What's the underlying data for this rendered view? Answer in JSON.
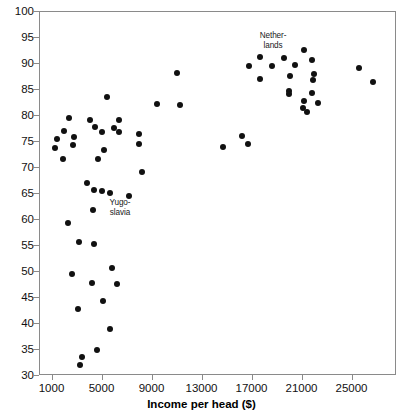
{
  "chart_data": {
    "type": "scatter",
    "title": "",
    "xlabel": "Income per head ($)",
    "ylabel": "",
    "xlim": [
      0,
      28560
    ],
    "ylim": [
      30,
      100
    ],
    "xticks": [
      1000,
      5000,
      9000,
      13000,
      17000,
      21000,
      25000
    ],
    "yticks": [
      30,
      35,
      40,
      45,
      50,
      55,
      60,
      65,
      70,
      75,
      80,
      85,
      90,
      95,
      100
    ],
    "grid": false,
    "legend": null,
    "point_color": "#111111",
    "frame_color": "#8a8a8a",
    "points": [
      {
        "label": "Philippines",
        "x": 2400,
        "y": 79.5,
        "lx": 78,
        "ly": 98,
        "align": "r"
      },
      {
        "label": "Brazil",
        "x": 4100,
        "y": 79.0,
        "lx": 127,
        "ly": 98,
        "align": "c"
      },
      {
        "label": "Ghana",
        "x": 2000,
        "y": 77.0,
        "lx": 73,
        "ly": 110,
        "align": "r"
      },
      {
        "label": "Mexico",
        "x": 4500,
        "y": 77.7,
        "lx": 135,
        "ly": 107,
        "align": "c"
      },
      {
        "label": "Colombia",
        "x": 5400,
        "y": 83.5,
        "lx": 125,
        "ly": 86,
        "align": "c"
      },
      {
        "label": "Nigeria",
        "x": 1400,
        "y": 75.3,
        "lx": 60,
        "ly": 123,
        "align": "r"
      },
      {
        "label": "China",
        "x": 2800,
        "y": 75.7,
        "lx": 97,
        "ly": 122,
        "align": "c"
      },
      {
        "label": "Venezuela",
        "x": 6400,
        "y": 79.0,
        "lx": 148,
        "ly": 97,
        "align": "c"
      },
      {
        "label": "Taiwan",
        "x": 9400,
        "y": 82.2,
        "lx": 155,
        "ly": 87,
        "align": "c"
      },
      {
        "label": "Uruguay",
        "x": 6000,
        "y": 77.5,
        "lx": 148,
        "ly": 111,
        "align": "c"
      },
      {
        "label": "Bangladesh",
        "x": 1300,
        "y": 73.7,
        "lx": 57,
        "ly": 139,
        "align": "r"
      },
      {
        "label": "Pakistan",
        "x": 2700,
        "y": 74.2,
        "lx": 96,
        "ly": 139,
        "align": "c"
      },
      {
        "label": "Dom. Rep.",
        "x": 5000,
        "y": 76.7,
        "lx": 134,
        "ly": 127,
        "align": "c"
      },
      {
        "label": "Argentina",
        "x": 6400,
        "y": 76.8,
        "lx": 158,
        "ly": 122,
        "align": "c"
      },
      {
        "label": "Chile",
        "x": 8000,
        "y": 76.4,
        "lx": 182,
        "ly": 113,
        "align": "c"
      },
      {
        "label": "Poland",
        "x": 5200,
        "y": 73.3,
        "lx": 140,
        "ly": 149,
        "align": "c"
      },
      {
        "label": "India",
        "x": 1900,
        "y": 71.5,
        "lx": 68,
        "ly": 156,
        "align": "c"
      },
      {
        "label": "Turkey",
        "x": 4700,
        "y": 71.5,
        "lx": 124,
        "ly": 164,
        "align": "c"
      },
      {
        "label": "Czech",
        "x": 8000,
        "y": 74.5,
        "lx": 174,
        "ly": 141,
        "align": "c"
      },
      {
        "label": "South Korea",
        "x": 11300,
        "y": 82.0,
        "lx": 195,
        "ly": 88,
        "align": "c"
      },
      {
        "label": "Puerto Rico",
        "x": 11000,
        "y": 88.0,
        "lx": 192,
        "ly": 70,
        "align": "c"
      },
      {
        "label": "Portugal",
        "x": 14700,
        "y": 73.8,
        "lx": 210,
        "ly": 123,
        "align": "c"
      },
      {
        "label": "Spain",
        "x": 16200,
        "y": 76.0,
        "lx": 227,
        "ly": 104,
        "align": "c"
      },
      {
        "label": "East Germany",
        "x": 16700,
        "y": 74.4,
        "lx": 248,
        "ly": 111,
        "align": "c"
      },
      {
        "label": "Slovenia",
        "x": 8200,
        "y": 69.0,
        "lx": 158,
        "ly": 173,
        "align": "c"
      },
      {
        "label": "S. Africa",
        "x": 3800,
        "y": 67.0,
        "lx": 97,
        "ly": 180,
        "align": "c"
      },
      {
        "label": "Croatia",
        "x": 5000,
        "y": 65.3,
        "lx": 138,
        "ly": 190,
        "align": "c"
      },
      {
        "label": "Slovakia",
        "x": 4400,
        "y": 65.5,
        "lx": 87,
        "ly": 200,
        "align": "c"
      },
      {
        "label": "Yugo-slavia",
        "x": 5700,
        "y": 65.0,
        "lx": 120,
        "ly": 198,
        "align": "c"
      },
      {
        "label": "Hungary",
        "x": 7200,
        "y": 64.5,
        "lx": 156,
        "ly": 201,
        "align": "c"
      },
      {
        "label": "Peru",
        "x": 4300,
        "y": 61.7,
        "lx": 97,
        "ly": 216,
        "align": "c"
      },
      {
        "label": "Macedonia",
        "x": 2300,
        "y": 59.2,
        "lx": 72,
        "ly": 217,
        "align": "c"
      },
      {
        "label": "Azerbaijan",
        "x": 3200,
        "y": 55.5,
        "lx": 86,
        "ly": 236,
        "align": "c"
      },
      {
        "label": "Latvia",
        "x": 4400,
        "y": 55.2,
        "lx": 115,
        "ly": 243,
        "align": "c"
      },
      {
        "label": "Estonia",
        "x": 5800,
        "y": 50.5,
        "lx": 136,
        "ly": 253,
        "align": "c"
      },
      {
        "label": "Romania",
        "x": 6200,
        "y": 47.5,
        "lx": 145,
        "ly": 279,
        "align": "c"
      },
      {
        "label": "Georgia",
        "x": 2600,
        "y": 49.5,
        "lx": 75,
        "ly": 279,
        "align": "c"
      },
      {
        "label": "Lithuania",
        "x": 4200,
        "y": 47.7,
        "lx": 105,
        "ly": 290,
        "align": "c"
      },
      {
        "label": "Armenia",
        "x": 3100,
        "y": 42.6,
        "lx": 78,
        "ly": 300,
        "align": "c"
      },
      {
        "label": "Bulgaria",
        "x": 5100,
        "y": 44.3,
        "lx": 123,
        "ly": 303,
        "align": "c"
      },
      {
        "label": "Russia",
        "x": 5700,
        "y": 38.9,
        "lx": 129,
        "ly": 330,
        "align": "c"
      },
      {
        "label": "Ukraine",
        "x": 3400,
        "y": 33.5,
        "lx": 83,
        "ly": 347,
        "align": "c"
      },
      {
        "label": "Belarus",
        "x": 4600,
        "y": 34.8,
        "lx": 133,
        "ly": 348,
        "align": "c"
      },
      {
        "label": "Moldova",
        "x": 3300,
        "y": 32.0,
        "lx": 105,
        "ly": 361,
        "align": "c"
      },
      {
        "label": "Ireland",
        "x": 16800,
        "y": 89.5,
        "lx": 221,
        "ly": 55,
        "align": "r"
      },
      {
        "label": "N. Ireland",
        "x": 17700,
        "y": 91.2,
        "lx": 248,
        "ly": 31,
        "align": "c"
      },
      {
        "label": "New Zealand",
        "x": 17700,
        "y": 87.0,
        "lx": 243,
        "ly": 72,
        "align": "c"
      },
      {
        "label": "Finland",
        "x": 18600,
        "y": 89.5,
        "lx": 258,
        "ly": 57,
        "align": "c"
      },
      {
        "label": "Nether-lands",
        "x": 19600,
        "y": 91.0,
        "lx": 273,
        "ly": 31,
        "align": "c"
      },
      {
        "label": "Sweden",
        "x": 20500,
        "y": 89.7,
        "lx": 295,
        "ly": 55,
        "align": "c"
      },
      {
        "label": "Iceland",
        "x": 21200,
        "y": 92.5,
        "lx": 296,
        "ly": 22,
        "align": "c"
      },
      {
        "label": "Denmark",
        "x": 21800,
        "y": 90.5,
        "lx": 325,
        "ly": 38,
        "align": "c"
      },
      {
        "label": "Australia",
        "x": 20100,
        "y": 87.5,
        "lx": 283,
        "ly": 67,
        "align": "c"
      },
      {
        "label": "Norway",
        "x": 22000,
        "y": 87.8,
        "lx": 340,
        "ly": 58,
        "align": "c"
      },
      {
        "label": "Belgium",
        "x": 21900,
        "y": 86.8,
        "lx": 328,
        "ly": 78,
        "align": "c"
      },
      {
        "label": "Britain",
        "x": 20000,
        "y": 84.6,
        "lx": 280,
        "ly": 80,
        "align": "c"
      },
      {
        "label": "Italy",
        "x": 20000,
        "y": 84.0,
        "lx": 279,
        "ly": 90,
        "align": "c"
      },
      {
        "label": "Canada",
        "x": 21800,
        "y": 84.2,
        "lx": 326,
        "ly": 89,
        "align": "c"
      },
      {
        "label": "France",
        "x": 21200,
        "y": 82.7,
        "lx": 303,
        "ly": 99,
        "align": "r"
      },
      {
        "label": "West Germany",
        "x": 22300,
        "y": 82.4,
        "lx": 353,
        "ly": 99,
        "align": "c"
      },
      {
        "label": "Japan",
        "x": 21100,
        "y": 81.4,
        "lx": 303,
        "ly": 109,
        "align": "r"
      },
      {
        "label": "Austria",
        "x": 21400,
        "y": 80.5,
        "lx": 318,
        "ly": 118,
        "align": "c"
      },
      {
        "label": "Switzerland",
        "x": 25600,
        "y": 89.0,
        "lx": 367,
        "ly": 44,
        "align": "c"
      },
      {
        "label": "U.S.A",
        "x": 26700,
        "y": 86.3,
        "lx": 360,
        "ly": 72,
        "align": "r"
      }
    ]
  },
  "axis": {
    "x_title": "Income per head ($)"
  }
}
